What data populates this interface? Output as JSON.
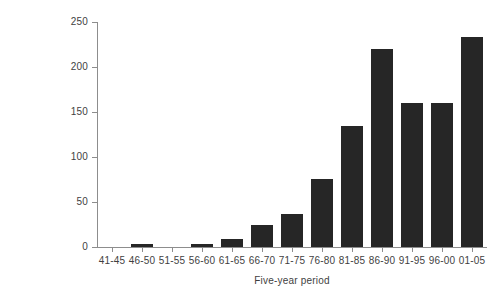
{
  "chart_data": {
    "type": "bar",
    "title": "",
    "xlabel": "Five-year period",
    "ylabel": "Number of birds",
    "categories": [
      "41-45",
      "46-50",
      "51-55",
      "56-60",
      "61-65",
      "66-70",
      "71-75",
      "76-80",
      "81-85",
      "86-90",
      "91-95",
      "96-00",
      "01-05"
    ],
    "values": [
      0,
      3,
      0,
      3,
      9,
      25,
      37,
      76,
      135,
      220,
      160,
      160,
      233
    ],
    "ylim": [
      0,
      250
    ],
    "yticks": [
      0,
      50,
      100,
      150,
      200,
      250
    ],
    "ytick_labels": [
      "0",
      "50",
      "100",
      "150",
      "200",
      "250"
    ],
    "grid": false,
    "legend": false,
    "bar_color": "#262626",
    "axis_color": "#8d8d8d",
    "text_color": "#3f3f3f"
  }
}
